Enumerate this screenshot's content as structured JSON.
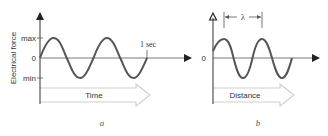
{
  "panels": [
    {
      "id": "a",
      "caption": "a",
      "y_axis_label": "Electrical force",
      "tick_labels": {
        "max": "max",
        "zero": "0",
        "min": "min"
      },
      "period_marker_label": "1 sec",
      "arrow_label": "Time",
      "cycles": 2
    },
    {
      "id": "b",
      "caption": "b",
      "tick_labels": {
        "zero": "0"
      },
      "wavelength_label": "λ",
      "arrow_label": "Distance",
      "cycles": 2
    }
  ],
  "colors": {
    "wave": "#555555",
    "axis": "#333333",
    "arrow_outline": "#d0d0d0",
    "text": "#333333"
  }
}
